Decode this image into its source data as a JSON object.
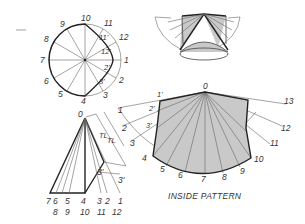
{
  "figure": {
    "caption": "INSIDE PATTERN",
    "colors": {
      "line": "#222222",
      "thin_line": "#666666",
      "shade": "#c9c9c9",
      "background": "#ffffff"
    }
  },
  "top_view": {
    "title": "Top view (circle divided into 12)",
    "outer_labels": [
      "1",
      "2",
      "3",
      "4",
      "5",
      "6",
      "7",
      "8",
      "9",
      "10",
      "11",
      "12"
    ],
    "inner_labels": [
      "11'",
      "12'",
      "2'",
      "3'"
    ]
  },
  "front_view": {
    "apex_label": "0",
    "true_length_labels": [
      "TL",
      "TL"
    ],
    "point_labels": [
      "3'",
      "3'"
    ],
    "base_labels_row1": [
      "7",
      "6",
      "5",
      "4",
      "3",
      "2",
      "1"
    ],
    "base_labels_row2": [
      "8",
      "9",
      "10",
      "11",
      "12"
    ]
  },
  "pictorial": {
    "title": "Pictorial of cone with shaded inside pattern"
  },
  "pattern": {
    "apex_label": "0",
    "arc_labels": [
      "1",
      "2",
      "3",
      "4",
      "5",
      "6",
      "7",
      "8",
      "9",
      "10",
      "11",
      "12",
      "13"
    ],
    "inner_labels": [
      "1'",
      "2'",
      "3'"
    ]
  }
}
